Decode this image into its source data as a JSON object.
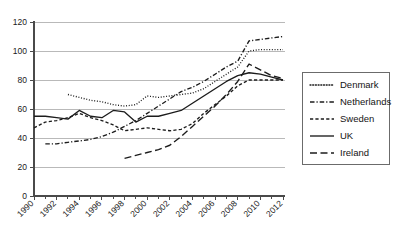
{
  "chart_data": {
    "type": "line",
    "title": "",
    "xlabel": "",
    "ylabel": "",
    "xlim": [
      1990,
      2012
    ],
    "ylim": [
      0,
      120
    ],
    "ytick_labels": [
      "0",
      "20",
      "40",
      "60",
      "80",
      "100",
      "120"
    ],
    "ytick_values": [
      0,
      20,
      40,
      60,
      80,
      100,
      120
    ],
    "xtick_labels": [
      "1990",
      "1992",
      "1994",
      "1996",
      "1998",
      "2000",
      "2002",
      "2004",
      "2006",
      "2008",
      "2010",
      "2012"
    ],
    "xtick_values": [
      1990,
      1992,
      1994,
      1996,
      1998,
      2000,
      2002,
      2004,
      2006,
      2008,
      2010,
      2012
    ],
    "minor_xticks_every": 1,
    "grid": "horizontal",
    "legend_position": "right-outside",
    "x": [
      1990,
      1991,
      1992,
      1993,
      1994,
      1995,
      1996,
      1997,
      1998,
      1999,
      2000,
      2001,
      2002,
      2003,
      2004,
      2005,
      2006,
      2007,
      2008,
      2009,
      2010,
      2011,
      2012
    ],
    "series": [
      {
        "name": "Denmark",
        "style": "dotted",
        "x": [
          1993,
          1994,
          1995,
          1996,
          1997,
          1998,
          1999,
          2000,
          2001,
          2002,
          2003,
          2004,
          2005,
          2006,
          2007,
          2008,
          2009,
          2010,
          2011,
          2012
        ],
        "values": [
          70,
          68,
          66,
          65,
          63,
          62,
          63,
          69,
          68,
          69,
          70,
          71,
          74,
          79,
          84,
          89,
          100,
          101,
          101,
          101
        ]
      },
      {
        "name": "Netherlands",
        "style": "dash-dot",
        "x": [
          1991,
          1992,
          1993,
          1994,
          1995,
          1996,
          1997,
          1998,
          1999,
          2000,
          2001,
          2002,
          2003,
          2004,
          2005,
          2006,
          2007,
          2008,
          2009,
          2010,
          2011,
          2012
        ],
        "values": [
          36,
          36,
          37,
          38,
          39,
          41,
          44,
          48,
          52,
          57,
          62,
          67,
          72,
          75,
          79,
          84,
          89,
          93,
          107,
          108,
          109,
          110
        ]
      },
      {
        "name": "Sweden",
        "style": "dashed",
        "x": [
          1990,
          1991,
          1992,
          1993,
          1994,
          1995,
          1996,
          1997,
          1998,
          1999,
          2000,
          2001,
          2002,
          2003,
          2004,
          2005,
          2006,
          2007,
          2008,
          2009,
          2010,
          2011,
          2012
        ],
        "values": [
          47,
          51,
          52,
          54,
          57,
          54,
          52,
          49,
          45,
          46,
          47,
          46,
          45,
          46,
          50,
          57,
          63,
          69,
          76,
          80,
          80,
          80,
          80
        ]
      },
      {
        "name": "UK",
        "style": "solid",
        "x": [
          1990,
          1991,
          1992,
          1993,
          1994,
          1995,
          1996,
          1997,
          1998,
          1999,
          2000,
          2001,
          2002,
          2003,
          2004,
          2005,
          2006,
          2007,
          2008,
          2009,
          2010,
          2011,
          2012
        ],
        "values": [
          55,
          55,
          54,
          53,
          59,
          55,
          54,
          59,
          58,
          51,
          55,
          55,
          57,
          59,
          64,
          69,
          74,
          79,
          83,
          85,
          84,
          82,
          80
        ]
      },
      {
        "name": "Ireland",
        "style": "long-dash",
        "x": [
          1998,
          1999,
          2000,
          2001,
          2002,
          2003,
          2004,
          2005,
          2006,
          2007,
          2008,
          2009,
          2010,
          2011,
          2012
        ],
        "values": [
          26,
          28,
          30,
          32,
          35,
          41,
          48,
          55,
          62,
          70,
          79,
          91,
          87,
          83,
          81
        ]
      }
    ]
  },
  "legend": {
    "items": [
      {
        "label": "Denmark",
        "style": "dotted"
      },
      {
        "label": "Netherlands",
        "style": "dash-dot"
      },
      {
        "label": "Sweden",
        "style": "dashed"
      },
      {
        "label": "UK",
        "style": "solid"
      },
      {
        "label": "Ireland",
        "style": "long-dash"
      }
    ]
  },
  "colors": {
    "line": "#1c1c1c",
    "grid": "#b9b9b9",
    "axis": "#4a4a4a",
    "text": "#141414",
    "background": "#ffffff"
  }
}
